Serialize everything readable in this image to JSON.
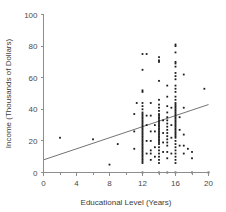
{
  "chart_data": {
    "type": "scatter",
    "title": "",
    "xlabel": "Educational Level (Years)",
    "ylabel": "Income (Thousands of Dollars)",
    "xlim": [
      0,
      20
    ],
    "ylim": [
      0,
      100
    ],
    "xticks": [
      0,
      4,
      8,
      12,
      16,
      20
    ],
    "yticks": [
      0,
      20,
      40,
      60,
      80,
      100
    ],
    "xtick_labels": [
      "0",
      "4",
      "8",
      "12",
      "16",
      "20"
    ],
    "ytick_labels": [
      "0",
      "20",
      "40",
      "60",
      "80",
      "100"
    ],
    "xminor_ticks": [
      2,
      6,
      10,
      14,
      18
    ],
    "grid": false,
    "legend": null,
    "point_color": "#1c1c1c",
    "line_color": "#737373",
    "axis_color": "#8d8d8d",
    "trend_line": {
      "label": "regression line",
      "x": [
        0,
        20
      ],
      "y": [
        8,
        43
      ]
    },
    "points": [
      [
        2,
        22
      ],
      [
        6,
        21
      ],
      [
        8,
        5
      ],
      [
        9,
        18
      ],
      [
        11,
        26
      ],
      [
        11,
        37
      ],
      [
        11,
        15
      ],
      [
        11.3,
        44
      ],
      [
        12,
        75
      ],
      [
        12,
        65
      ],
      [
        12,
        52
      ],
      [
        12,
        51
      ],
      [
        12,
        44
      ],
      [
        12,
        42
      ],
      [
        12,
        40
      ],
      [
        12,
        38
      ],
      [
        12,
        37
      ],
      [
        12,
        36
      ],
      [
        12,
        35
      ],
      [
        12,
        34
      ],
      [
        12,
        33
      ],
      [
        12,
        32
      ],
      [
        12,
        31
      ],
      [
        12,
        30
      ],
      [
        12,
        29
      ],
      [
        12,
        28
      ],
      [
        12,
        27
      ],
      [
        12,
        26
      ],
      [
        12,
        25
      ],
      [
        12,
        24
      ],
      [
        12,
        23
      ],
      [
        12,
        22
      ],
      [
        12,
        21
      ],
      [
        12,
        20
      ],
      [
        12,
        19
      ],
      [
        12,
        18
      ],
      [
        12,
        17
      ],
      [
        12,
        16
      ],
      [
        12,
        15
      ],
      [
        12,
        14
      ],
      [
        12,
        13
      ],
      [
        12,
        12
      ],
      [
        12,
        11
      ],
      [
        12,
        10
      ],
      [
        12,
        9
      ],
      [
        12,
        8
      ],
      [
        12,
        7
      ],
      [
        12,
        6
      ],
      [
        12,
        0
      ],
      [
        12.5,
        75
      ],
      [
        12.5,
        36
      ],
      [
        12.5,
        30
      ],
      [
        12.5,
        20
      ],
      [
        12.5,
        12
      ],
      [
        13,
        44
      ],
      [
        13,
        36
      ],
      [
        13,
        26
      ],
      [
        13,
        20
      ],
      [
        13,
        14
      ],
      [
        13,
        12
      ],
      [
        13,
        8
      ],
      [
        13.5,
        30
      ],
      [
        13.5,
        26
      ],
      [
        13.5,
        16
      ],
      [
        13.5,
        10
      ],
      [
        14,
        73
      ],
      [
        14,
        71
      ],
      [
        14,
        70
      ],
      [
        14,
        58
      ],
      [
        14,
        46
      ],
      [
        14,
        43
      ],
      [
        14,
        41
      ],
      [
        14,
        39
      ],
      [
        14,
        37
      ],
      [
        14,
        36
      ],
      [
        14,
        35
      ],
      [
        14,
        34
      ],
      [
        14,
        33
      ],
      [
        14,
        32
      ],
      [
        14,
        31
      ],
      [
        14,
        30
      ],
      [
        14,
        29
      ],
      [
        14,
        28
      ],
      [
        14,
        27
      ],
      [
        14,
        26
      ],
      [
        14,
        25
      ],
      [
        14,
        24
      ],
      [
        14,
        23
      ],
      [
        14,
        22
      ],
      [
        14,
        21
      ],
      [
        14,
        20
      ],
      [
        14,
        19
      ],
      [
        14,
        18
      ],
      [
        14,
        16
      ],
      [
        14,
        14
      ],
      [
        14,
        12
      ],
      [
        14,
        10
      ],
      [
        14,
        8
      ],
      [
        14,
        6
      ],
      [
        14,
        0
      ],
      [
        14.5,
        33
      ],
      [
        14.5,
        25
      ],
      [
        14.5,
        19
      ],
      [
        14.5,
        13
      ],
      [
        15,
        55
      ],
      [
        15,
        48
      ],
      [
        15,
        42
      ],
      [
        15,
        38
      ],
      [
        15,
        35
      ],
      [
        15,
        33
      ],
      [
        15,
        31
      ],
      [
        15,
        29
      ],
      [
        15,
        27
      ],
      [
        15,
        25
      ],
      [
        15,
        23
      ],
      [
        15,
        21
      ],
      [
        15,
        19
      ],
      [
        15,
        17
      ],
      [
        15,
        13
      ],
      [
        15,
        9
      ],
      [
        15,
        0
      ],
      [
        15.5,
        41
      ],
      [
        15.5,
        30
      ],
      [
        15.5,
        22
      ],
      [
        15.5,
        12
      ],
      [
        16,
        81
      ],
      [
        16,
        80
      ],
      [
        16,
        76
      ],
      [
        16,
        70
      ],
      [
        16,
        69
      ],
      [
        16,
        67
      ],
      [
        16,
        63
      ],
      [
        16,
        61
      ],
      [
        16,
        59
      ],
      [
        16,
        55
      ],
      [
        16,
        53
      ],
      [
        16,
        51
      ],
      [
        16,
        48
      ],
      [
        16,
        46
      ],
      [
        16,
        44
      ],
      [
        16,
        43
      ],
      [
        16,
        42
      ],
      [
        16,
        41
      ],
      [
        16,
        40
      ],
      [
        16,
        39
      ],
      [
        16,
        38
      ],
      [
        16,
        37
      ],
      [
        16,
        36
      ],
      [
        16,
        35
      ],
      [
        16,
        34
      ],
      [
        16,
        33
      ],
      [
        16,
        32
      ],
      [
        16,
        31
      ],
      [
        16,
        30
      ],
      [
        16,
        29
      ],
      [
        16,
        28
      ],
      [
        16,
        27
      ],
      [
        16,
        26
      ],
      [
        16,
        25
      ],
      [
        16,
        24
      ],
      [
        16,
        23
      ],
      [
        16,
        22
      ],
      [
        16,
        20
      ],
      [
        16,
        18
      ],
      [
        16,
        16
      ],
      [
        16,
        14
      ],
      [
        16,
        12
      ],
      [
        16,
        10
      ],
      [
        16,
        8
      ],
      [
        16,
        6
      ],
      [
        16,
        0
      ],
      [
        16.5,
        35
      ],
      [
        16.5,
        27
      ],
      [
        16.5,
        17
      ],
      [
        17,
        62
      ],
      [
        17,
        41
      ],
      [
        17,
        24
      ],
      [
        17,
        17
      ],
      [
        17,
        12
      ],
      [
        17.5,
        15
      ],
      [
        18,
        13
      ],
      [
        18,
        9
      ],
      [
        18,
        0
      ],
      [
        19.5,
        53
      ],
      [
        20,
        0
      ]
    ]
  }
}
